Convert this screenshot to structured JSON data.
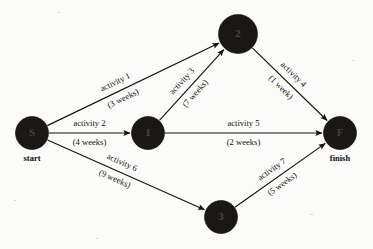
{
  "diagram": {
    "title_watermark": "",
    "nodes": [
      {
        "id": "S",
        "label": "S",
        "caption": "start",
        "cx": 32,
        "cy": 133,
        "r": 16.5
      },
      {
        "id": "1",
        "label": "1",
        "caption": "",
        "cx": 148,
        "cy": 133,
        "r": 16.5
      },
      {
        "id": "2",
        "label": "2",
        "caption": "",
        "cx": 238,
        "cy": 34,
        "r": 19.5
      },
      {
        "id": "3",
        "label": "3",
        "caption": "",
        "cx": 221,
        "cy": 217,
        "r": 16.5
      },
      {
        "id": "F",
        "label": "F",
        "caption": "finish",
        "cx": 340,
        "cy": 133,
        "r": 16.5
      }
    ],
    "edges": [
      {
        "name": "activity 1",
        "duration": "(3 weeks)",
        "from": "S",
        "to": "2",
        "x1": 32,
        "y1": 133,
        "x2": 238,
        "y2": 34,
        "label_t": 0.42,
        "label_offset": -9,
        "dur_offset": 9,
        "angle": -25.7
      },
      {
        "name": "activity 2",
        "duration": "(4 weeks)",
        "from": "S",
        "to": "1",
        "x1": 32,
        "y1": 133,
        "x2": 148,
        "y2": 133,
        "label_t": 0.5,
        "label_offset": -9,
        "dur_offset": 10,
        "angle": 0
      },
      {
        "name": "activity 3",
        "duration": "(7 weeks)",
        "from": "1",
        "to": "2",
        "x1": 148,
        "y1": 133,
        "x2": 238,
        "y2": 34,
        "label_t": 0.46,
        "label_offset": -9,
        "dur_offset": 9,
        "angle": -47.7
      },
      {
        "name": "activity 4",
        "duration": "(1 week)",
        "from": "2",
        "to": "F",
        "x1": 238,
        "y1": 34,
        "x2": 340,
        "y2": 133,
        "label_t": 0.46,
        "label_offset": -9,
        "dur_offset": 9,
        "angle": 44.1
      },
      {
        "name": "activity 5",
        "duration": "(2 weeks)",
        "from": "1",
        "to": "F",
        "x1": 148,
        "y1": 133,
        "x2": 340,
        "y2": 133,
        "label_t": 0.5,
        "label_offset": -9,
        "dur_offset": 10,
        "angle": 0
      },
      {
        "name": "activity 6",
        "duration": "(9 weeks)",
        "from": "S",
        "to": "3",
        "x1": 32,
        "y1": 133,
        "x2": 221,
        "y2": 217,
        "label_t": 0.45,
        "label_offset": -9,
        "dur_offset": 9,
        "angle": 24.0
      },
      {
        "name": "activity 7",
        "duration": "(5 weeks)",
        "from": "3",
        "to": "F",
        "x1": 221,
        "y1": 217,
        "x2": 340,
        "y2": 133,
        "label_t": 0.47,
        "label_offset": -9,
        "dur_offset": 9,
        "angle": -35.2
      }
    ],
    "colors": {
      "node_fill": "#1a1715",
      "edge_stroke": "#16130f",
      "text": "#14110f",
      "background": "#fbfbfa"
    }
  }
}
